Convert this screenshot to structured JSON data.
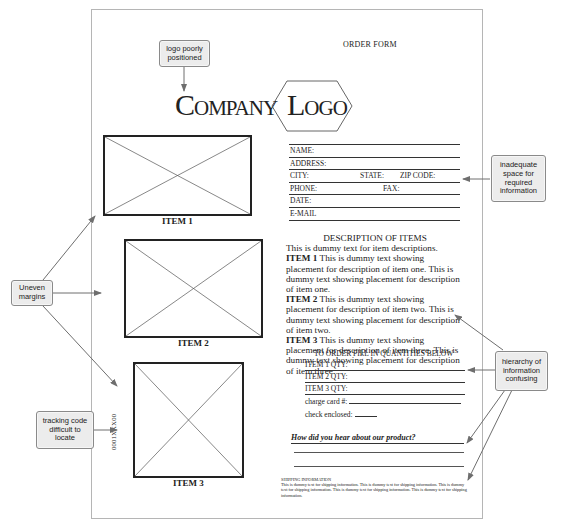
{
  "form": {
    "title": "ORDER FORM",
    "logo": {
      "company_initial": "C",
      "company_rest": "OMPANY",
      "logo_initial": "L",
      "logo_rest": "OGO"
    },
    "items": [
      {
        "label": "ITEM 1"
      },
      {
        "label": "ITEM 2"
      },
      {
        "label": "ITEM 3"
      }
    ],
    "tracking_code": "0001XXX00",
    "contact_fields": {
      "name": "NAME:",
      "address": "ADDRESS:",
      "city": "CITY:",
      "state": "STATE:",
      "zip": "ZIP CODE:",
      "phone": "PHONE:",
      "fax": "FAX:",
      "date": "DATE:",
      "email": "E-MAIL"
    },
    "description": {
      "heading": "DESCRIPTION OF ITEMS",
      "intro": "This is dummy text for item descriptions.",
      "entries": [
        {
          "label": "ITEM 1",
          "text": " This is dummy text showing placement for description of item one. This is dummy text showing placement for description of item one."
        },
        {
          "label": "ITEM 2",
          "text": " This is dummy text showing placement for description of item two. This is dummy text showing placement for description of item two."
        },
        {
          "label": "ITEM 3",
          "text": " This is dummy text showing placement for description of item three. This is dummy text showing placement for description of item three."
        }
      ]
    },
    "order": {
      "heading": "TO ORDER FILL IN QUANTITIES BELOW",
      "qty_1": "ITEM 1 QTY:",
      "qty_2": "ITEM 2 QTY:",
      "qty_3": "ITEM 3 QTY:",
      "charge_card": "charge card #:",
      "check_enclosed": "check enclosed:"
    },
    "survey_question": "How did you hear about our product?",
    "shipping": {
      "heading": "SHIPPING INFORMATION",
      "text": "This is dummy text for shipping information. This is dummy text for shipping information. This is dummy text for shipping information. This is dummy text for shipping information. This is dummy text for shipping information."
    }
  },
  "callouts": {
    "logo": "logo poorly positioned",
    "space": "inadequate space for required information",
    "margins": "Uneven margins",
    "tracking": "tracking code difficult to locate",
    "hierarchy": "hierarchy of information confusing"
  },
  "colors": {
    "callout_fill": "#ececec",
    "callout_border": "#8a8a8a",
    "arrow": "#6e6e6e",
    "page_border": "#b5b5b5"
  }
}
